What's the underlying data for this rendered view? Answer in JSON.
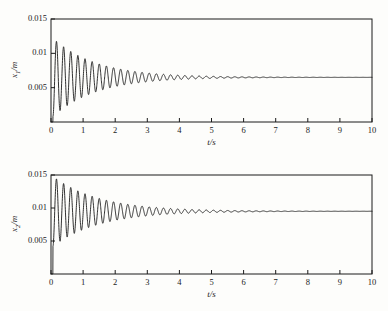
{
  "figure": {
    "background": "#fdfdfb",
    "line_color": "#1b1b1b",
    "axis_color": "#1b1b1b"
  },
  "chart_data": [
    {
      "type": "line",
      "id": "x1-response",
      "title": "",
      "xlabel": "t/s",
      "ylabel": "x1/m",
      "ylabel_base": "x",
      "ylabel_sub": "1",
      "ylabel_unit": "/m",
      "xlim": [
        0,
        10
      ],
      "ylim": [
        0,
        0.015
      ],
      "xticks": [
        0,
        1,
        2,
        3,
        4,
        5,
        6,
        7,
        8,
        9,
        10
      ],
      "xtick_labels": [
        "0",
        "1",
        "2",
        "3",
        "4",
        "5",
        "6",
        "7",
        "8",
        "9",
        "10"
      ],
      "yticks": [
        0.005,
        0.01,
        0.015
      ],
      "ytick_labels": [
        "0.005",
        "0.01",
        "0.015"
      ],
      "grid": false,
      "legend": null,
      "series": [
        {
          "name": "x1",
          "description": "damped oscillation settling to steady state",
          "steady_state": 0.0065,
          "initial_value": 0.0,
          "first_peak_value": 0.0122,
          "first_peak_time": 0.23,
          "first_trough_value": 0.0009,
          "frequency_hz": 4.5,
          "damping_time_constant_s": 1.35,
          "t_start": 0.06
        }
      ]
    },
    {
      "type": "line",
      "id": "x2-response",
      "title": "",
      "xlabel": "t/s",
      "ylabel": "x2/m",
      "ylabel_base": "x",
      "ylabel_sub": "2",
      "ylabel_unit": "/m",
      "xlim": [
        0,
        10
      ],
      "ylim": [
        0,
        0.015
      ],
      "xticks": [
        0,
        1,
        2,
        3,
        4,
        5,
        6,
        7,
        8,
        9,
        10
      ],
      "xtick_labels": [
        "0",
        "1",
        "2",
        "3",
        "4",
        "5",
        "6",
        "7",
        "8",
        "9",
        "10"
      ],
      "yticks": [
        0.005,
        0.01,
        0.015
      ],
      "ytick_labels": [
        "0.005",
        "0.01",
        "0.015"
      ],
      "grid": false,
      "legend": null,
      "series": [
        {
          "name": "x2",
          "description": "damped oscillation settling to steady state",
          "steady_state": 0.0095,
          "initial_value": 0.0,
          "first_peak_value": 0.0148,
          "first_peak_time": 0.23,
          "first_trough_value": 0.0042,
          "frequency_hz": 4.5,
          "damping_time_constant_s": 1.45,
          "t_start": 0.06
        }
      ]
    }
  ]
}
